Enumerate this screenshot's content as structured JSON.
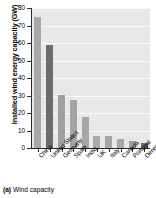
{
  "figure": {
    "caption_label": "(a)",
    "caption_text": "Wind capacity"
  },
  "chart_data": {
    "type": "bar",
    "title": "",
    "xlabel": "",
    "ylabel": "Installed wind energy capacity (GW)",
    "ylim": [
      0,
      80
    ],
    "yticks": [
      0,
      10,
      20,
      30,
      40,
      50,
      60,
      70,
      80
    ],
    "grid": true,
    "legend": "none",
    "categories": [
      "China",
      "United States",
      "Germany",
      "Spain",
      "India",
      "UK",
      "Italy",
      "Canada",
      "Portugal",
      "Denmark"
    ],
    "values": [
      75,
      59,
      30.2,
      27.5,
      17.5,
      7.1,
      7.0,
      5.2,
      4.1,
      2.8
    ],
    "bar_colors": [
      "#a9a9a9",
      "#6d6d6d",
      "#a0a0a0",
      "#a3a3a3",
      "#a6a6a6",
      "#aaaaaa",
      "#a4a4a4",
      "#a7a7a7",
      "#9e9e9e",
      "#6a6a6a"
    ],
    "plot_background": "#e8e8e8",
    "gridline_color": "#fafafa",
    "axis_color": "#2b2b2b"
  }
}
